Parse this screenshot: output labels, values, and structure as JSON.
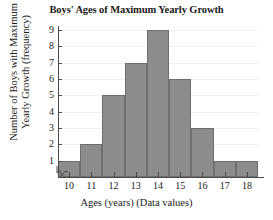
{
  "chart_data": {
    "type": "bar",
    "title": "Boys' Ages of Maximum Yearly Growth",
    "xlabel": "Ages (years) (Data values)",
    "ylabel_line1": "Number of Boys with Maximum",
    "ylabel_line2": "Yearly Growth (frequency)",
    "categories": [
      "10",
      "11",
      "12",
      "13",
      "14",
      "15",
      "16",
      "17",
      "18"
    ],
    "values": [
      1,
      2,
      5,
      7,
      9,
      6,
      3,
      1,
      1
    ],
    "xlim": [
      9.5,
      18.5
    ],
    "ylim": [
      0,
      9
    ],
    "yticks": [
      "9",
      "8",
      "7",
      "6",
      "5",
      "4",
      "3",
      "2",
      "1"
    ],
    "ytick_values": [
      9,
      8,
      7,
      6,
      5,
      4,
      3,
      2,
      1
    ],
    "grid": true,
    "legend": "none",
    "bar_color": "#8c8c8c",
    "bar_edge_color": "#6e6e6e",
    "axis_color": "#4a4a4a",
    "grid_color": "#f0f0f0",
    "background": "#ffffff",
    "axis_break": "x-axis-break-zigzag"
  }
}
